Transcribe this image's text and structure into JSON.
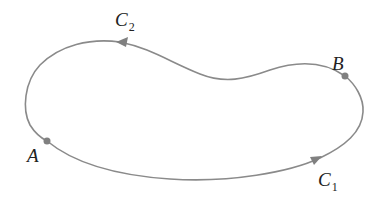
{
  "diagram": {
    "curve_color": "#8a8a8a",
    "point_color": "#808080",
    "points": [
      {
        "id": "A",
        "label": "A"
      },
      {
        "id": "B",
        "label": "B"
      }
    ],
    "curves": [
      {
        "id": "C1",
        "letter": "C",
        "subscript": "1",
        "direction": "A to B along bottom"
      },
      {
        "id": "C2",
        "letter": "C",
        "subscript": "2",
        "direction": "B to A along top"
      }
    ]
  }
}
